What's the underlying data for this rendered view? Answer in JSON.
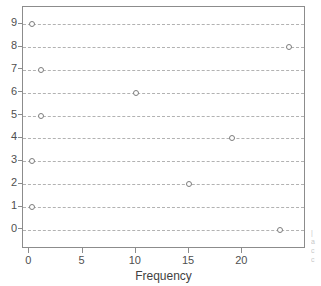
{
  "chart_data": {
    "type": "scatter",
    "title": "",
    "subtitle": "",
    "xlabel": "Frequency",
    "ylabel": "",
    "xlim": [
      -0.6,
      25.8
    ],
    "ylim": [
      -0.75,
      9.75
    ],
    "grid": "horizontal-dashed",
    "legend": "none",
    "orientation": "horizontal-dot-plot",
    "categories": [
      "0",
      "1",
      "2",
      "3",
      "4",
      "5",
      "6",
      "7",
      "8",
      "9"
    ],
    "values": [
      23.5,
      0.2,
      15.0,
      0.2,
      19.0,
      1.1,
      10.0,
      1.1,
      24.4,
      0.2
    ],
    "points": [
      {
        "category": "9",
        "frequency": 0.2
      },
      {
        "category": "8",
        "frequency": 24.4
      },
      {
        "category": "7",
        "frequency": 1.1
      },
      {
        "category": "6",
        "frequency": 10.0
      },
      {
        "category": "5",
        "frequency": 1.1
      },
      {
        "category": "4",
        "frequency": 19.0
      },
      {
        "category": "3",
        "frequency": 0.2
      },
      {
        "category": "2",
        "frequency": 15.0
      },
      {
        "category": "1",
        "frequency": 0.2
      },
      {
        "category": "0",
        "frequency": 23.5
      }
    ],
    "xticks": [
      0,
      5,
      10,
      15,
      20
    ],
    "xticklabels": [
      "0",
      "5",
      "10",
      "15",
      "20"
    ],
    "yticks": [
      0,
      1,
      2,
      3,
      4,
      5,
      6,
      7,
      8,
      9
    ],
    "yticklabels": [
      "0",
      "1",
      "2",
      "3",
      "4",
      "5",
      "6",
      "7",
      "8",
      "9"
    ],
    "colors": {
      "marker_edge": "#7d7d7d",
      "marker_face": "#ffffff",
      "gridline": "#aeaeae",
      "frame": "#8c8c8c",
      "text": "#4f4f4f",
      "background": "#ffffff"
    }
  },
  "margin_text": {
    "lines": [
      "|",
      "a",
      "c",
      "c"
    ]
  }
}
